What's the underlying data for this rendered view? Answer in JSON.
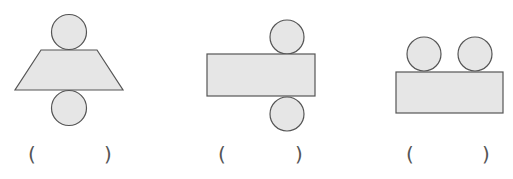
{
  "figures": [
    {
      "name": "trapezoid-with-two-circles",
      "shapes": [
        "circle",
        "trapezoid",
        "circle"
      ],
      "answer_blank": {
        "open": "(",
        "close": ")",
        "value": ""
      }
    },
    {
      "name": "rectangle-with-two-circles-offset",
      "shapes": [
        "circle",
        "rectangle",
        "circle"
      ],
      "answer_blank": {
        "open": "(",
        "close": ")",
        "value": ""
      }
    },
    {
      "name": "rectangle-with-two-circles-on-top",
      "shapes": [
        "circle",
        "circle",
        "rectangle"
      ],
      "answer_blank": {
        "open": "(",
        "close": ")",
        "value": ""
      }
    }
  ],
  "colors": {
    "fill": "#e6e6e6",
    "stroke": "#555555",
    "background": "#ffffff"
  }
}
